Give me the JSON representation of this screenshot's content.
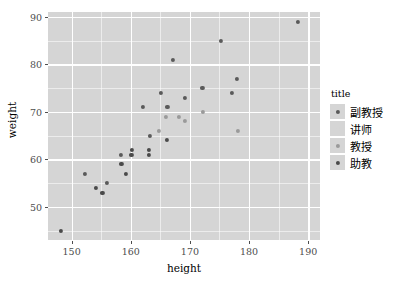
{
  "chart_data": {
    "type": "scatter",
    "title": "",
    "xlabel": "height",
    "ylabel": "weight",
    "xlim": [
      146,
      192
    ],
    "ylim": [
      43,
      91
    ],
    "xticks": [
      150,
      160,
      170,
      180,
      190
    ],
    "yticks": [
      50,
      60,
      70,
      80,
      90
    ],
    "grid": true,
    "legend": {
      "title": "title",
      "position": "right",
      "entries": [
        {
          "label": "副教授",
          "color": "#5a5a5a"
        },
        {
          "label": "讲师",
          "color": "#d5d5d5"
        },
        {
          "label": "教授",
          "color": "#9a9a9a"
        },
        {
          "label": "助教",
          "color": "#4a4a4a"
        }
      ]
    },
    "series": [
      {
        "name": "副教授",
        "color": "#5a5a5a",
        "points": [
          {
            "x": 152.2,
            "y": 57
          },
          {
            "x": 156.0,
            "y": 55
          },
          {
            "x": 158.3,
            "y": 61
          },
          {
            "x": 162.1,
            "y": 71
          },
          {
            "x": 163.2,
            "y": 65
          },
          {
            "x": 165.1,
            "y": 74
          },
          {
            "x": 166.2,
            "y": 71
          },
          {
            "x": 167.1,
            "y": 81
          },
          {
            "x": 169.2,
            "y": 73
          },
          {
            "x": 172.1,
            "y": 75
          },
          {
            "x": 175.2,
            "y": 85
          },
          {
            "x": 177.1,
            "y": 74
          },
          {
            "x": 178.0,
            "y": 77
          },
          {
            "x": 188.2,
            "y": 89
          }
        ]
      },
      {
        "name": "讲师",
        "color": "#d5d5d5",
        "points": []
      },
      {
        "name": "教授",
        "color": "#9a9a9a",
        "points": [
          {
            "x": 164.8,
            "y": 66
          },
          {
            "x": 165.9,
            "y": 69
          },
          {
            "x": 168.2,
            "y": 69
          },
          {
            "x": 169.1,
            "y": 68
          },
          {
            "x": 172.2,
            "y": 70
          },
          {
            "x": 178.1,
            "y": 66
          }
        ]
      },
      {
        "name": "助教",
        "color": "#4a4a4a",
        "points": [
          {
            "x": 148.2,
            "y": 45
          },
          {
            "x": 154.1,
            "y": 54
          },
          {
            "x": 155.2,
            "y": 53
          },
          {
            "x": 158.4,
            "y": 59
          },
          {
            "x": 159.2,
            "y": 57
          },
          {
            "x": 160.1,
            "y": 61
          },
          {
            "x": 160.2,
            "y": 62
          },
          {
            "x": 163.0,
            "y": 61
          },
          {
            "x": 163.1,
            "y": 62
          },
          {
            "x": 166.1,
            "y": 64
          }
        ]
      }
    ]
  },
  "panel": {
    "background": "#d5d5d5",
    "gridline_color": "#ffffff"
  }
}
